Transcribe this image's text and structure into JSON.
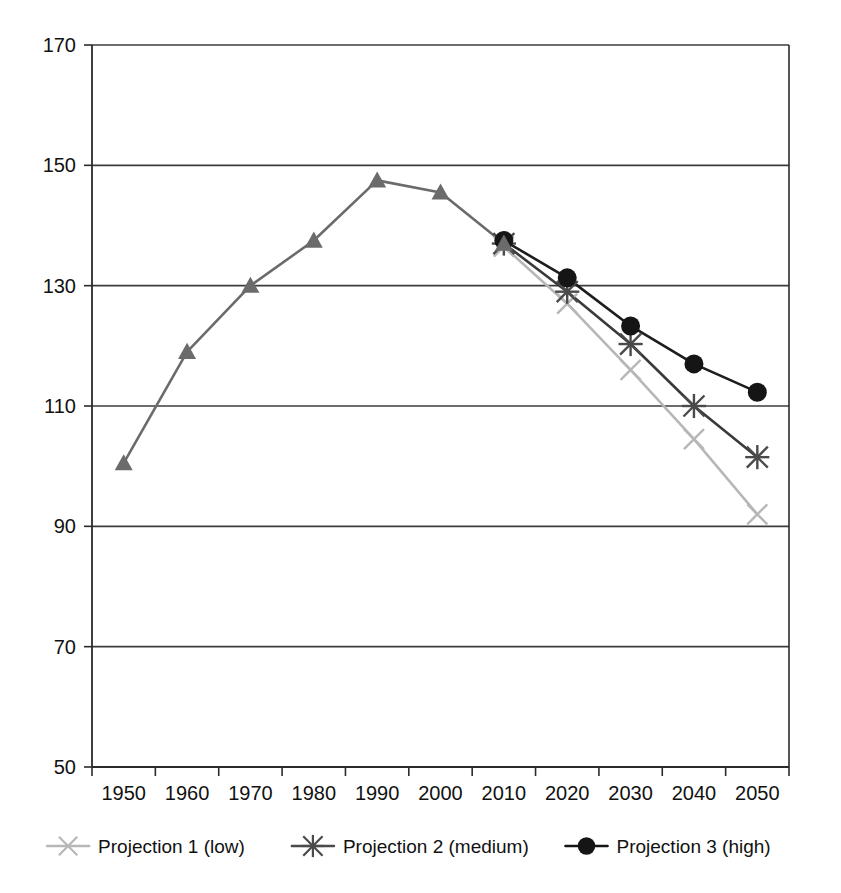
{
  "chart_data": {
    "type": "line",
    "title": "",
    "subtitle": "",
    "xlabel": "",
    "ylabel": "",
    "categories": [
      "1950",
      "1960",
      "1970",
      "1980",
      "1990",
      "2000",
      "2010",
      "2020",
      "2030",
      "2040",
      "2050"
    ],
    "x_tick_labels": [
      "1950",
      "1960",
      "1970",
      "1980",
      "1990",
      "2000",
      "2010",
      "2020",
      "2030",
      "2040",
      "2050"
    ],
    "y_tick_labels": [
      "50",
      "70",
      "90",
      "110",
      "130",
      "150",
      "170"
    ],
    "y_ticks": [
      50,
      70,
      90,
      110,
      130,
      150,
      170
    ],
    "ylim": [
      50,
      170
    ],
    "grid": "horizontal",
    "legend_position": "bottom",
    "series": [
      {
        "name": "Historical",
        "in_legend": false,
        "marker": "triangle",
        "color": "#6b6b6b",
        "line_color": "#6b6b6b",
        "x": [
          "1950",
          "1960",
          "1970",
          "1980",
          "1990",
          "2000",
          "2010"
        ],
        "values": [
          100.5,
          119.0,
          130.0,
          137.5,
          147.5,
          145.5,
          137.0
        ]
      },
      {
        "name": "Projection 1 (low)",
        "in_legend": true,
        "marker": "x",
        "color": "#b7b7b7",
        "line_color": "#b7b7b7",
        "x": [
          "2010",
          "2020",
          "2030",
          "2040",
          "2050"
        ],
        "values": [
          136.5,
          127.0,
          116.0,
          104.5,
          92.0
        ]
      },
      {
        "name": "Projection 2 (medium)",
        "in_legend": true,
        "marker": "star",
        "color": "#4a4a4a",
        "line_color": "#3a3a3a",
        "x": [
          "2010",
          "2020",
          "2030",
          "2040",
          "2050"
        ],
        "values": [
          137.0,
          129.0,
          120.3,
          110.0,
          101.5
        ]
      },
      {
        "name": "Projection 3 (high)",
        "in_legend": true,
        "marker": "circle",
        "color": "#151515",
        "line_color": "#1d1d1d",
        "x": [
          "2010",
          "2020",
          "2030",
          "2040",
          "2050"
        ],
        "values": [
          137.5,
          131.3,
          123.3,
          117.0,
          112.3
        ]
      }
    ],
    "legend": [
      {
        "label": "Projection 1 (low)",
        "marker": "x",
        "color": "#b7b7b7"
      },
      {
        "label": "Projection 2 (medium)",
        "marker": "star",
        "color": "#4a4a4a"
      },
      {
        "label": "Projection 3 (high)",
        "marker": "circle",
        "color": "#151515"
      }
    ],
    "colors": {
      "axis": "#2b2b2b",
      "grid": "#3c3c3c",
      "historical": "#6b6b6b",
      "low": "#b7b7b7",
      "medium": "#4a4a4a",
      "high": "#151515",
      "background": "#ffffff"
    }
  }
}
